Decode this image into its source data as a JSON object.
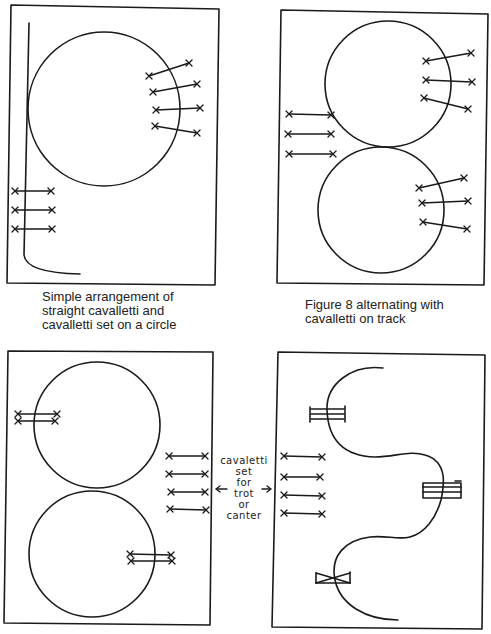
{
  "figures": [
    {
      "id": "panel-1",
      "caption": "Simple arrangement of\nstraight cavalletti and\ncavalletti set on a circle",
      "elements": [
        "arena",
        "circle",
        "track-line",
        "cavalletti-on-circle x4",
        "straight-cavalletti x3"
      ]
    },
    {
      "id": "panel-2",
      "caption": "Figure 8 alternating with\ncavalletti on track",
      "elements": [
        "arena",
        "figure-8 top circle",
        "figure-8 bottom circle",
        "cavalletti-on-circle x3 top",
        "cavalletti-on-circle x3 bottom",
        "straight-cavalletti x3 left"
      ]
    },
    {
      "id": "panel-3",
      "caption": "",
      "elements": [
        "arena",
        "top circle",
        "bottom circle",
        "double cavalletti on circles x2",
        "straight-cavalletti x4"
      ]
    },
    {
      "id": "panel-4",
      "caption": "",
      "elements": [
        "arena",
        "serpentine path",
        "jump-obstacles x3",
        "straight-cavalletti x4"
      ]
    }
  ],
  "annotation": {
    "lines": [
      "cavaletti",
      "set",
      "for",
      "trot",
      "or",
      "canter"
    ],
    "left_arrow": "←",
    "right_arrow": "→"
  },
  "colors": {
    "ink": "#1a1a1a",
    "paper": "#ffffff"
  }
}
